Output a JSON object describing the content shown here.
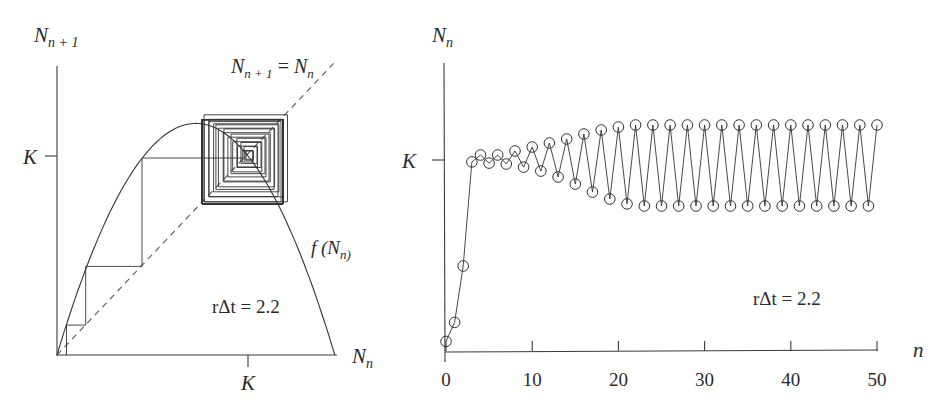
{
  "figure": {
    "left_panel": {
      "title": "Cobweb map",
      "y_axis_label_main": "N",
      "y_axis_label_sub": "n + 1",
      "x_axis_label_main": "N",
      "x_axis_label_sub": "n",
      "x_tick_label": "K",
      "y_tick_label": "K",
      "diagonal_label_lhs_main": "N",
      "diagonal_label_lhs_sub": "n + 1",
      "diagonal_label_eq": " = ",
      "diagonal_label_rhs_main": "N",
      "diagonal_label_rhs_sub": "n",
      "curve_label_prefix": "f (N",
      "curve_label_sub": "n)",
      "parameter_label": "rΔt = 2.2"
    },
    "right_panel": {
      "y_axis_label_main": "N",
      "y_axis_label_sub": "n",
      "x_axis_label": "n",
      "y_tick_label": "K",
      "x_tick_labels": [
        "0",
        "10",
        "20",
        "30",
        "40",
        "50"
      ],
      "parameter_label": "rΔt = 2.2"
    }
  },
  "chart_data": [
    {
      "type": "line",
      "title": "Cobweb diagram of discrete logistic map",
      "xlabel": "N_n",
      "ylabel": "N_{n+1}",
      "x_ticks": [
        "K"
      ],
      "y_ticks": [
        "K"
      ],
      "parameter": {
        "name": "rΔt",
        "value": 2.2
      },
      "series": [
        {
          "name": "f(N_n)",
          "style": "solid",
          "x_range_in_K": [
            0,
            1.4545
          ],
          "peak_in_K": {
            "x": 0.727,
            "y": 1.164
          }
        },
        {
          "name": "N_{n+1} = N_n",
          "style": "dashed",
          "x_range_in_K": [
            0,
            1.45
          ]
        },
        {
          "name": "cobweb trajectory",
          "style": "solid",
          "converges_to_two_cycle_in_K": [
            0.759,
            1.183
          ]
        }
      ],
      "annotations": [
        "N_{n+1} = N_n",
        "f(N_n)",
        "rΔt = 2.2"
      ]
    },
    {
      "type": "line",
      "title": "Time series of N_n",
      "xlabel": "n",
      "ylabel": "N_n",
      "xlim": [
        0,
        50
      ],
      "x_ticks": [
        0,
        10,
        20,
        30,
        40,
        50
      ],
      "y_ticks": [
        "K"
      ],
      "marker": "open-circle",
      "parameter": {
        "name": "rΔt",
        "value": 2.2
      },
      "x": [
        0,
        1,
        2,
        3,
        4,
        5,
        6,
        7,
        8,
        9,
        10,
        11,
        12,
        13,
        14,
        15,
        16,
        17,
        18,
        19,
        20,
        21,
        22,
        23,
        24,
        25,
        26,
        27,
        28,
        29,
        30,
        31,
        32,
        33,
        34,
        35,
        36,
        37,
        38,
        39,
        40,
        41,
        42,
        43,
        44,
        45,
        46,
        47,
        48,
        49,
        50
      ],
      "series": [
        {
          "name": "N_n / K",
          "values": [
            0.05,
            0.15,
            0.445,
            0.99,
            1.026,
            0.984,
            1.026,
            0.979,
            1.047,
            0.963,
            1.068,
            0.942,
            1.089,
            0.911,
            1.11,
            0.874,
            1.136,
            0.832,
            1.157,
            0.796,
            1.173,
            0.77,
            1.183,
            0.759,
            1.183,
            0.759,
            1.183,
            0.759,
            1.183,
            0.759,
            1.183,
            0.759,
            1.183,
            0.759,
            1.183,
            0.759,
            1.183,
            0.759,
            1.183,
            0.759,
            1.183,
            0.759,
            1.183,
            0.759,
            1.183,
            0.759,
            1.183,
            0.759,
            1.183,
            0.759,
            1.183
          ]
        }
      ],
      "annotations": [
        "rΔt = 2.2"
      ]
    }
  ],
  "style": {
    "line_color": "#333333",
    "dash_color": "#555555",
    "background": "#ffffff"
  }
}
